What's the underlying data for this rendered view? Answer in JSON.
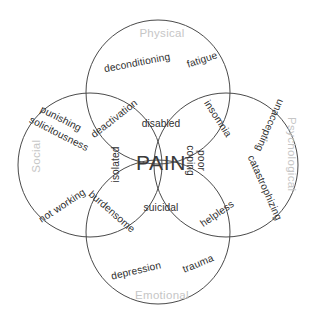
{
  "diagram": {
    "type": "venn",
    "title": "PAIN",
    "canvas": {
      "width": 322,
      "height": 323
    },
    "stroke_color": "#4a4a4a",
    "domain_label_color": "#c6c6c6",
    "item_label_color": "#2f2f2f",
    "core_label_color": "#3a3a3a",
    "background": "#ffffff"
  },
  "core": {
    "label": "PAIN"
  },
  "domains": [
    {
      "id": "physical",
      "label": "Physical"
    },
    {
      "id": "social",
      "label": "Social"
    },
    {
      "id": "psychological",
      "label": "Psychological"
    },
    {
      "id": "emotional",
      "label": "Emotional"
    }
  ],
  "items": {
    "physical_only_1": "deconditioning",
    "physical_only_2": "fatigue",
    "social_only_1": "punishing",
    "social_only_2": "solicitousness",
    "social_only_3": "not working",
    "psychological_only_1": "unaccepting",
    "psychological_only_2": "catastrophizing",
    "emotional_only_1": "depression",
    "emotional_only_2": "trauma",
    "physical_social": "deactivation",
    "physical_psychological": "insomnia",
    "social_emotional": "burdensome",
    "psychological_emotional": "helpless",
    "center_top": "disabled",
    "center_bottom": "suicidal",
    "center_left": "isolated",
    "center_right_line1": "poor",
    "center_right_line2": "coping"
  }
}
